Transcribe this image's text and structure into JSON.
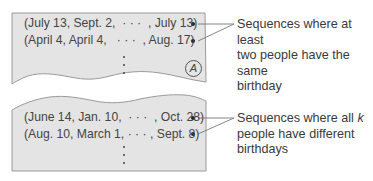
{
  "top_panel": {
    "rows": [
      "(July 13, Sept. 2,  · · ·  , July 13)",
      "(April 4, April 4,   · · ·  , Aug. 17)"
    ],
    "marker": "A",
    "label_line1": "Sequences where at least",
    "label_line2": "two people have the same",
    "label_line3": "birthday"
  },
  "bottom_panel": {
    "rows": [
      "(June 14, Jan. 10,  · · ·  , Oct. 28)",
      "(Aug. 10, March 1, · · · , Sept. 8)"
    ],
    "label_line1_prefix": "Sequences where all ",
    "label_line1_var": "k",
    "label_line2": "people have different",
    "label_line3": "birthdays"
  },
  "colors": {
    "panel_fill": "#e4e4e4",
    "panel_edge": "#9a9a9a",
    "text": "#444444"
  }
}
